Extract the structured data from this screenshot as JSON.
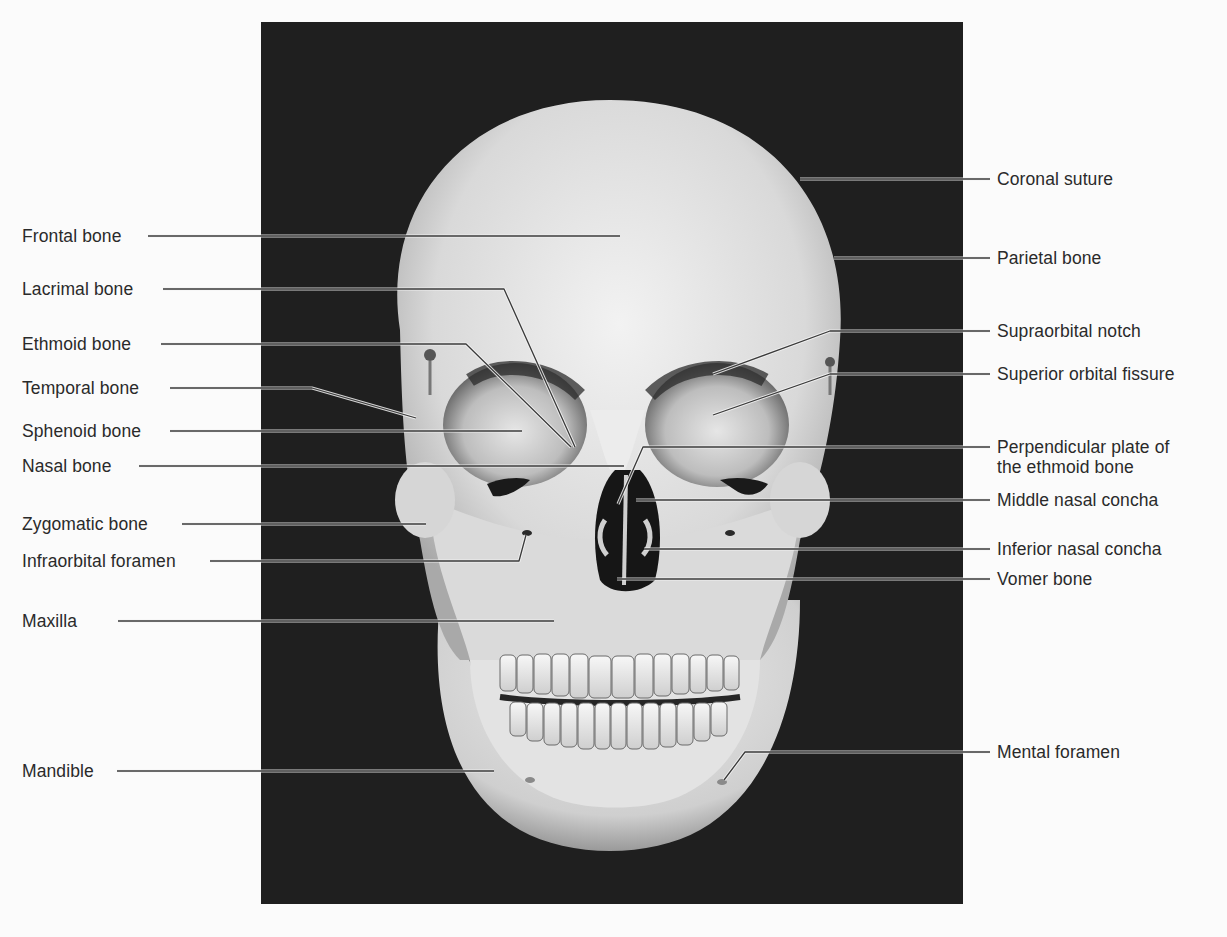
{
  "figure": {
    "background_color": "#fbfbfb",
    "photo_background_color": "#1f1f1f",
    "bone_color": "#e2e2e2",
    "leader_line_color": "#3a3a3a"
  },
  "labels": {
    "left": [
      {
        "text": "Frontal bone",
        "y": 236
      },
      {
        "text": "Lacrimal bone",
        "y": 289
      },
      {
        "text": "Ethmoid bone",
        "y": 344
      },
      {
        "text": "Temporal bone",
        "y": 388
      },
      {
        "text": "Sphenoid bone",
        "y": 431
      },
      {
        "text": "Nasal bone",
        "y": 466
      },
      {
        "text": "Zygomatic bone",
        "y": 524
      },
      {
        "text": "Infraorbital foramen",
        "y": 561
      },
      {
        "text": "Maxilla",
        "y": 621
      },
      {
        "text": "Mandible",
        "y": 771
      }
    ],
    "right": [
      {
        "text": "Coronal suture",
        "y": 179
      },
      {
        "text": "Parietal bone",
        "y": 258
      },
      {
        "text": "Supraorbital notch",
        "y": 331
      },
      {
        "text": "Superior orbital fissure",
        "y": 374
      },
      {
        "text": "Perpendicular plate of",
        "text2": "the ethmoid bone",
        "y": 447
      },
      {
        "text": "Middle nasal concha",
        "y": 500
      },
      {
        "text": "Inferior nasal concha",
        "y": 549
      },
      {
        "text": "Vomer bone",
        "y": 579
      },
      {
        "text": "Mental foramen",
        "y": 752
      }
    ]
  }
}
